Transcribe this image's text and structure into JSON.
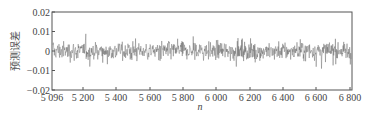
{
  "chart_data": {
    "type": "line",
    "title": "",
    "xlabel": "n",
    "ylabel": "预测误差",
    "xlim": [
      5096,
      6810
    ],
    "ylim": [
      -0.02,
      0.02
    ],
    "grid": false,
    "legend": null,
    "x_ticks": [
      {
        "value": 5096,
        "label": "5 096",
        "px": 52
      },
      {
        "value": 5200,
        "label": "5 200",
        "px": 83
      },
      {
        "value": 5400,
        "label": "5 400",
        "px": 116
      },
      {
        "value": 5600,
        "label": "5 600",
        "px": 150
      },
      {
        "value": 5800,
        "label": "5 800",
        "px": 183
      },
      {
        "value": 6000,
        "label": "6 000",
        "px": 216
      },
      {
        "value": 6200,
        "label": "6 200",
        "px": 250
      },
      {
        "value": 6400,
        "label": "6 400",
        "px": 283
      },
      {
        "value": 6600,
        "label": "6 600",
        "px": 316
      },
      {
        "value": 6800,
        "label": "6 800",
        "px": 350
      }
    ],
    "y_ticks": [
      {
        "value": 0.02,
        "label": "0.02"
      },
      {
        "value": 0.01,
        "label": "0.01"
      },
      {
        "value": 0,
        "label": "0"
      },
      {
        "value": -0.01,
        "label": "−0.01"
      },
      {
        "value": -0.02,
        "label": "−0.02"
      }
    ],
    "series": [
      {
        "name": "prediction error",
        "color": "#555555",
        "description": "Dense noise-like residual oscillating around 0, mostly within ±0.01, occasional spikes to about +0.013 / −0.013",
        "n_start": 5096,
        "n_end": 6810,
        "mean": 0.0,
        "typical_amplitude": 0.006,
        "max": 0.013,
        "min": -0.013
      }
    ]
  },
  "plot": {
    "frame": {
      "left": 52,
      "top": 12,
      "right": 352,
      "bottom": 90
    },
    "frame_color": "#555555",
    "line_color": "#5a5a5a"
  }
}
